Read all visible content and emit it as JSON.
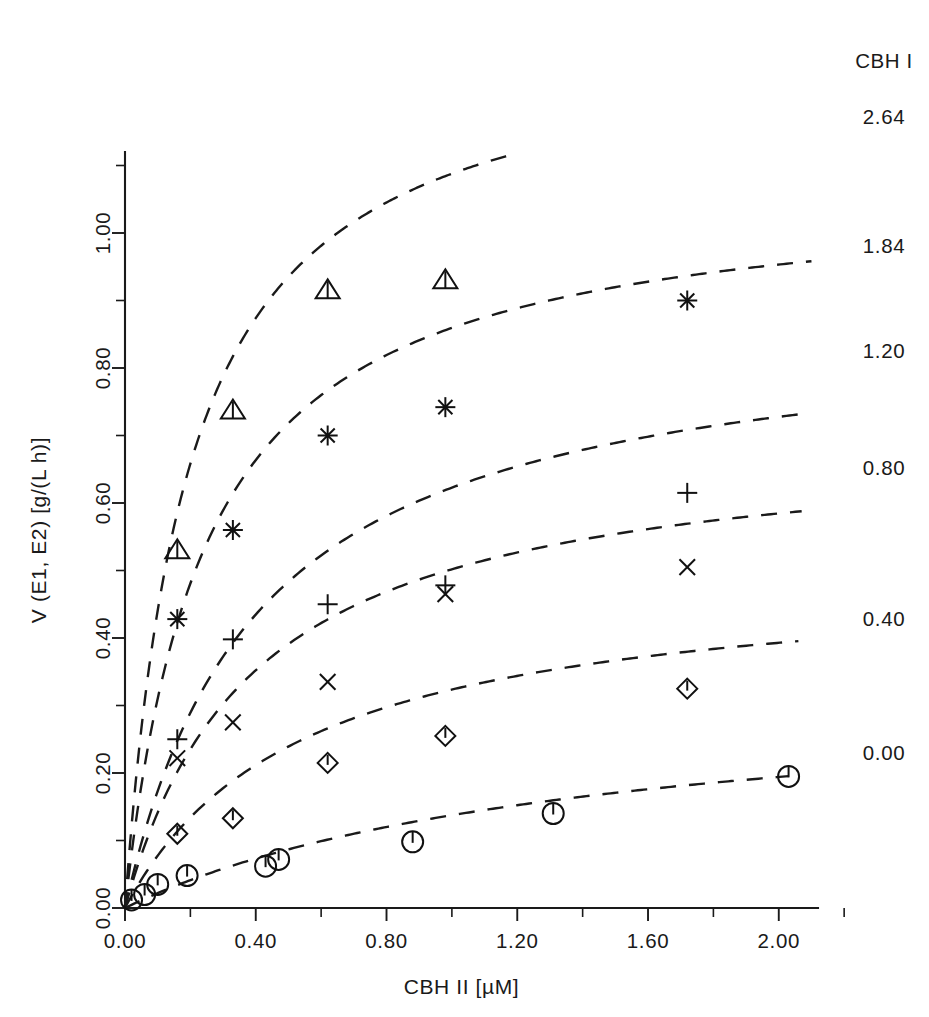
{
  "figure": {
    "background": "#ffffff",
    "ink_color": "#1a1a1a"
  },
  "axes": {
    "x_axis_label": "CBH II   [µM]",
    "y_axis_label": "V (E1, E2)  [g/(L h)]",
    "x_ticks": [
      "0.00",
      "0.40",
      "0.80",
      "1.20",
      "1.60",
      "2.00"
    ],
    "y_ticks": [
      "0.00",
      "0.20",
      "0.40",
      "0.60",
      "0.80",
      "1.00"
    ]
  },
  "right_legend": {
    "header": "CBH I",
    "values": [
      "2.64",
      "1.84",
      "1.20",
      "0.80",
      "0.40",
      "0.00"
    ]
  },
  "chart_data": {
    "type": "scatter",
    "title": "",
    "subtitle": "",
    "xlabel": "CBH II   [µM]",
    "ylabel": "V (E1, E2)  [g/(L h)]",
    "xlim": [
      0.0,
      2.12
    ],
    "ylim": [
      0.0,
      1.12
    ],
    "xticks": [
      0.0,
      0.4,
      0.8,
      1.2,
      1.6,
      2.0
    ],
    "yticks": [
      0.0,
      0.2,
      0.4,
      0.6,
      0.8,
      1.0
    ],
    "minor_ticks": true,
    "grid": false,
    "legend_position": "right-outside",
    "legend_title": "CBH I",
    "series": [
      {
        "name": "2.64",
        "legend_label": "2.64",
        "marker": "triangle",
        "points": [
          {
            "x": 0.0,
            "y": 0.005
          },
          {
            "x": 0.16,
            "y": 0.53
          },
          {
            "x": 0.33,
            "y": 0.737
          },
          {
            "x": 0.62,
            "y": 0.915
          },
          {
            "x": 0.98,
            "y": 0.93
          }
        ],
        "fit_curve": {
          "model": "michaelis-menten",
          "vmax": 1.3,
          "km": 0.195
        }
      },
      {
        "name": "1.84",
        "legend_label": "1.84",
        "marker": "asterisk",
        "points": [
          {
            "x": 0.0,
            "y": 0.005
          },
          {
            "x": 0.16,
            "y": 0.428
          },
          {
            "x": 0.33,
            "y": 0.56
          },
          {
            "x": 0.62,
            "y": 0.7
          },
          {
            "x": 0.98,
            "y": 0.742
          },
          {
            "x": 1.72,
            "y": 0.9
          }
        ],
        "fit_curve": {
          "model": "michaelis-menten",
          "vmax": 1.07,
          "km": 0.245
        }
      },
      {
        "name": "1.20",
        "legend_label": "1.20",
        "marker": "plus",
        "points": [
          {
            "x": 0.0,
            "y": 0.005
          },
          {
            "x": 0.16,
            "y": 0.25
          },
          {
            "x": 0.33,
            "y": 0.398
          },
          {
            "x": 0.62,
            "y": 0.45
          },
          {
            "x": 0.98,
            "y": 0.478
          },
          {
            "x": 1.72,
            "y": 0.615
          }
        ],
        "fit_curve": {
          "model": "michaelis-menten",
          "vmax": 0.875,
          "km": 0.405
        }
      },
      {
        "name": "0.80",
        "legend_label": "0.80",
        "marker": "cross",
        "points": [
          {
            "x": 0.0,
            "y": 0.005
          },
          {
            "x": 0.16,
            "y": 0.222
          },
          {
            "x": 0.33,
            "y": 0.275
          },
          {
            "x": 0.62,
            "y": 0.335
          },
          {
            "x": 0.98,
            "y": 0.465
          },
          {
            "x": 1.72,
            "y": 0.505
          }
        ],
        "fit_curve": {
          "model": "michaelis-menten",
          "vmax": 0.7,
          "km": 0.395
        }
      },
      {
        "name": "0.40",
        "legend_label": "0.40",
        "marker": "diamond",
        "points": [
          {
            "x": 0.0,
            "y": 0.005
          },
          {
            "x": 0.16,
            "y": 0.11
          },
          {
            "x": 0.33,
            "y": 0.133
          },
          {
            "x": 0.62,
            "y": 0.215
          },
          {
            "x": 0.98,
            "y": 0.255
          },
          {
            "x": 1.72,
            "y": 0.325
          }
        ],
        "fit_curve": {
          "model": "michaelis-menten",
          "vmax": 0.5,
          "km": 0.545
        }
      },
      {
        "name": "0.00",
        "legend_label": "0.00",
        "marker": "circle-tick",
        "points": [
          {
            "x": 0.02,
            "y": 0.012
          },
          {
            "x": 0.06,
            "y": 0.02
          },
          {
            "x": 0.1,
            "y": 0.035
          },
          {
            "x": 0.19,
            "y": 0.048
          },
          {
            "x": 0.43,
            "y": 0.062
          },
          {
            "x": 0.47,
            "y": 0.072
          },
          {
            "x": 0.88,
            "y": 0.098
          },
          {
            "x": 1.31,
            "y": 0.14
          },
          {
            "x": 2.03,
            "y": 0.195
          }
        ],
        "fit_curve": {
          "model": "michaelis-menten",
          "vmax": 0.33,
          "km": 1.4
        }
      }
    ]
  }
}
